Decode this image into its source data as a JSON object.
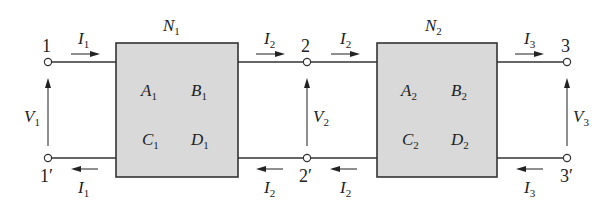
{
  "diagram": {
    "networks": [
      {
        "name": "N",
        "name_sub": "1",
        "params": [
          {
            "sym": "A",
            "sub": "1"
          },
          {
            "sym": "B",
            "sub": "1"
          },
          {
            "sym": "C",
            "sub": "1"
          },
          {
            "sym": "D",
            "sub": "1"
          }
        ]
      },
      {
        "name": "N",
        "name_sub": "2",
        "params": [
          {
            "sym": "A",
            "sub": "2"
          },
          {
            "sym": "B",
            "sub": "2"
          },
          {
            "sym": "C",
            "sub": "2"
          },
          {
            "sym": "D",
            "sub": "2"
          }
        ]
      }
    ],
    "terminals": {
      "t1": "1",
      "t1p": "1′",
      "t2": "2",
      "t2p": "2′",
      "t3": "3",
      "t3p": "3′"
    },
    "voltages": [
      {
        "sym": "V",
        "sub": "1"
      },
      {
        "sym": "V",
        "sub": "2"
      },
      {
        "sym": "V",
        "sub": "3"
      }
    ],
    "currents": {
      "top_left_in": {
        "sym": "I",
        "sub": "1"
      },
      "bot_left_out": {
        "sym": "I",
        "sub": "1"
      },
      "top_n1_out": {
        "sym": "I",
        "sub": "2"
      },
      "bot_n1_in": {
        "sym": "I",
        "sub": "2"
      },
      "top_n2_in": {
        "sym": "I",
        "sub": "2"
      },
      "bot_n2_out": {
        "sym": "I",
        "sub": "2"
      },
      "top_right_out": {
        "sym": "I",
        "sub": "3"
      },
      "bot_right_in": {
        "sym": "I",
        "sub": "3"
      }
    },
    "colors": {
      "box_fill": "#d9d9d9",
      "line": "#333333",
      "background": "#ffffff"
    }
  }
}
